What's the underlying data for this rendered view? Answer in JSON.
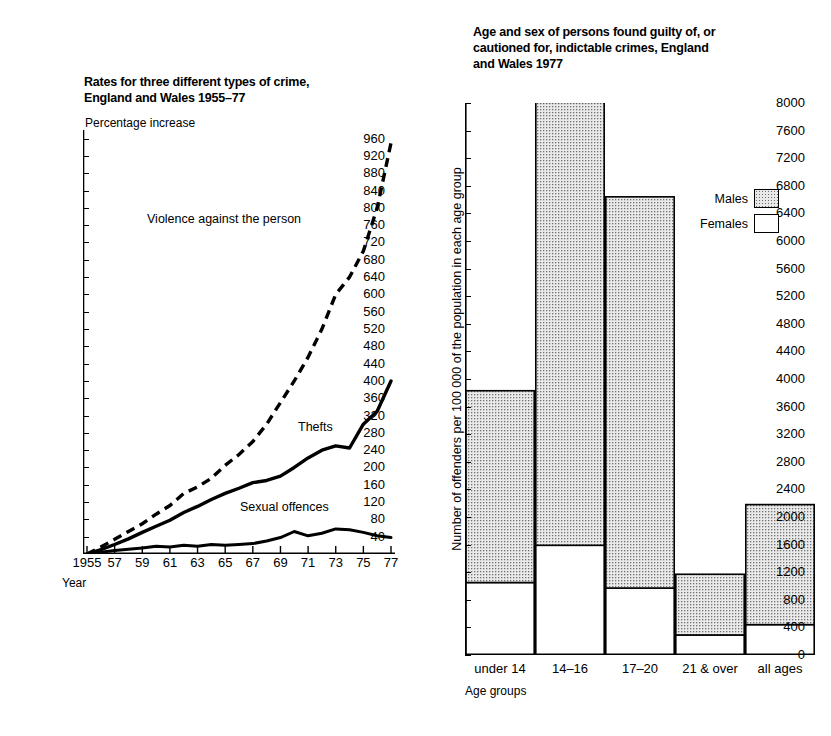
{
  "left_chart": {
    "title": "Rates for three different types of crime,\nEngland and Wales 1955–77",
    "y_axis_label": "Percentage increase",
    "x_axis_label": "Year",
    "series_labels": {
      "violence": "Violence against the person",
      "thefts": "Thefts",
      "sexual": "Sexual offences"
    }
  },
  "right_chart": {
    "title": "Age and sex of persons found guilty of, or\ncautioned for, indictable crimes, England\nand Wales 1977",
    "y_axis_label": "Number of offenders per 100 000 of the population in each age group",
    "x_axis_label": "Age groups",
    "legend": [
      {
        "label": "Males",
        "swatch": "stippled"
      },
      {
        "label": "Females",
        "swatch": "white"
      }
    ]
  },
  "chart_data": [
    {
      "type": "line",
      "title": "Rates for three different types of crime, England and Wales 1955-77",
      "xlabel": "Year",
      "ylabel": "Percentage increase",
      "xlim": [
        1955,
        1977
      ],
      "ylim": [
        0,
        980
      ],
      "yticks": [
        40,
        80,
        120,
        160,
        200,
        240,
        280,
        320,
        360,
        400,
        440,
        480,
        520,
        560,
        600,
        640,
        680,
        720,
        760,
        800,
        840,
        880,
        920,
        960
      ],
      "xticks": [
        1955,
        1957,
        1959,
        1961,
        1963,
        1965,
        1967,
        1969,
        1971,
        1973,
        1975,
        1977
      ],
      "xticklabels": [
        "1955",
        "57",
        "59",
        "61",
        "63",
        "65",
        "67",
        "69",
        "71",
        "73",
        "75",
        "77"
      ],
      "grid": false,
      "legend_position": "inline-annotations",
      "x": [
        1955,
        1956,
        1957,
        1958,
        1959,
        1960,
        1961,
        1962,
        1963,
        1964,
        1965,
        1966,
        1967,
        1968,
        1969,
        1970,
        1971,
        1972,
        1973,
        1974,
        1975,
        1976,
        1977
      ],
      "series": [
        {
          "name": "Violence against the person",
          "style": "dashed",
          "values": [
            0,
            16,
            34,
            52,
            70,
            92,
            112,
            140,
            155,
            175,
            205,
            230,
            260,
            300,
            350,
            400,
            455,
            520,
            600,
            640,
            700,
            800,
            950
          ]
        },
        {
          "name": "Thefts",
          "style": "solid",
          "values": [
            0,
            10,
            22,
            35,
            50,
            64,
            78,
            96,
            110,
            126,
            140,
            152,
            165,
            170,
            180,
            200,
            222,
            240,
            250,
            245,
            300,
            330,
            400
          ]
        },
        {
          "name": "Sexual offences",
          "style": "solid",
          "values": [
            0,
            4,
            8,
            11,
            14,
            18,
            16,
            20,
            18,
            22,
            20,
            22,
            24,
            30,
            38,
            52,
            42,
            48,
            58,
            56,
            50,
            42,
            38
          ]
        }
      ]
    },
    {
      "type": "bar",
      "subtype": "stacked",
      "title": "Age and sex of persons found guilty of, or cautioned for, indictable crimes, England and Wales 1977",
      "xlabel": "Age groups",
      "ylabel": "Number of offenders per 100 000 of the population in each age group",
      "categories": [
        "under 14",
        "14–16",
        "17–20",
        "21 & over",
        "all ages"
      ],
      "ylim": [
        0,
        8000
      ],
      "yticks": [
        0,
        400,
        800,
        1200,
        1600,
        2000,
        2400,
        2800,
        3200,
        3600,
        4000,
        4400,
        4800,
        5200,
        5600,
        6000,
        6400,
        6800,
        7200,
        7600,
        8000
      ],
      "grid": false,
      "legend_position": "right",
      "series": [
        {
          "name": "Females",
          "fill": "white",
          "values": [
            1050,
            1590,
            970,
            290,
            440
          ]
        },
        {
          "name": "Males",
          "fill": "stippled",
          "values": [
            2780,
            6420,
            5670,
            880,
            1740
          ]
        }
      ],
      "totals": [
        3830,
        8010,
        6640,
        1170,
        2180
      ]
    }
  ]
}
